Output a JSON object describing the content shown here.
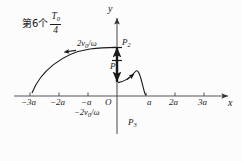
{
  "figure": {
    "annotation": {
      "prefix_cn": "第6个",
      "fraction_numerator": "T",
      "fraction_numerator_sub": "0",
      "fraction_denominator": "4",
      "full_text": "第6个 T0/4"
    },
    "axes": {
      "y_label": "y",
      "x_label": "x",
      "origin_label": "O",
      "x_ticks": [
        "−3a",
        "−2a",
        "−a",
        "a",
        "2a",
        "3a"
      ],
      "axis_color": "#555555"
    },
    "value_labels": {
      "positive_velocity": "2v0/ω",
      "positive_velocity_main": "2v",
      "positive_velocity_sub": "0",
      "positive_velocity_tail": "/ω",
      "negative_velocity": "−2v0/ω",
      "negative_velocity_sign": "−",
      "negative_velocity_main": "2v",
      "negative_velocity_sub": "0",
      "negative_velocity_tail": "/ω"
    },
    "points": [
      {
        "id": "P1",
        "main": "P",
        "sub": "1"
      },
      {
        "id": "P2",
        "main": "P",
        "sub": "2"
      },
      {
        "id": "P3",
        "main": "P",
        "sub": "3"
      }
    ],
    "curve_color": "#1a1a1a"
  }
}
